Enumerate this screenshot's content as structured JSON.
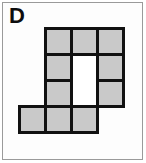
{
  "figure": {
    "label": "D",
    "label_name": "panel-letter-label",
    "colors": {
      "cell_fill": "#c9c9c9",
      "cell_outline": "#111111",
      "hole_fill": "#ffffff",
      "frame_border": "#9a9a9a",
      "panel_background": "#ffffff",
      "label_color": "#0d0d0d"
    },
    "grid": {
      "columns": 4,
      "rows": 4,
      "cell_size_px": 29,
      "outline_width_px": 3,
      "filled_cell_count": 9
    },
    "cells": [
      {
        "row": 1,
        "col": 1,
        "state": "empty"
      },
      {
        "row": 1,
        "col": 2,
        "state": "filled"
      },
      {
        "row": 1,
        "col": 3,
        "state": "filled"
      },
      {
        "row": 1,
        "col": 4,
        "state": "filled"
      },
      {
        "row": 2,
        "col": 1,
        "state": "empty"
      },
      {
        "row": 2,
        "col": 2,
        "state": "filled"
      },
      {
        "row": 2,
        "col": 3,
        "state": "hole"
      },
      {
        "row": 2,
        "col": 4,
        "state": "filled"
      },
      {
        "row": 3,
        "col": 1,
        "state": "empty"
      },
      {
        "row": 3,
        "col": 2,
        "state": "filled"
      },
      {
        "row": 3,
        "col": 3,
        "state": "hole"
      },
      {
        "row": 3,
        "col": 4,
        "state": "filled"
      },
      {
        "row": 4,
        "col": 1,
        "state": "filled"
      },
      {
        "row": 4,
        "col": 2,
        "state": "filled"
      },
      {
        "row": 4,
        "col": 3,
        "state": "filled"
      },
      {
        "row": 4,
        "col": 4,
        "state": "empty"
      }
    ]
  }
}
